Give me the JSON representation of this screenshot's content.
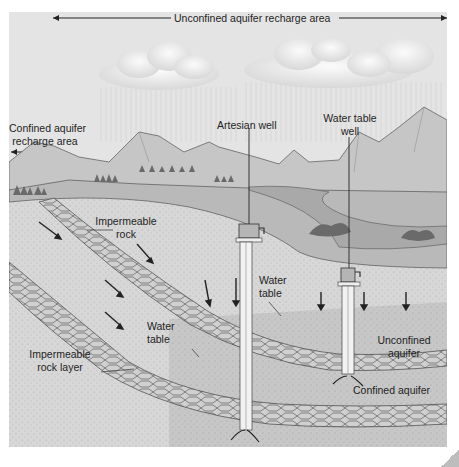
{
  "diagram": {
    "title_arrow_label": "Unconfined aquifer recharge area",
    "labels": {
      "confined_recharge_line1": "Confined aquifer",
      "confined_recharge_line2": "recharge area",
      "artesian_well": "Artesian well",
      "water_table_well_line1": "Water table",
      "water_table_well_line2": "well",
      "impermeable_rock_line1": "Impermeable",
      "impermeable_rock_line2": "rock",
      "water_table_left_line1": "Water",
      "water_table_left_line2": "table",
      "water_table_right_line1": "Water",
      "water_table_right_line2": "table",
      "impermeable_layer_line1": "Impermeable",
      "impermeable_layer_line2": "rock layer",
      "unconfined_aquifer_line1": "Unconfined",
      "unconfined_aquifer_line2": "aquifer",
      "confined_aquifer": "Confined aquifer"
    },
    "colors": {
      "sky": "#e4e4e4",
      "mountains": "#c4c4c4",
      "ground_surface": "#b8b8b8",
      "lake": "#a8a8a8",
      "unsaturated_soil": "#d6d6d6",
      "saturated_zone": "#c3c3c3",
      "rock_layer": "#cfcfcf",
      "line": "#3a3a3a"
    }
  }
}
